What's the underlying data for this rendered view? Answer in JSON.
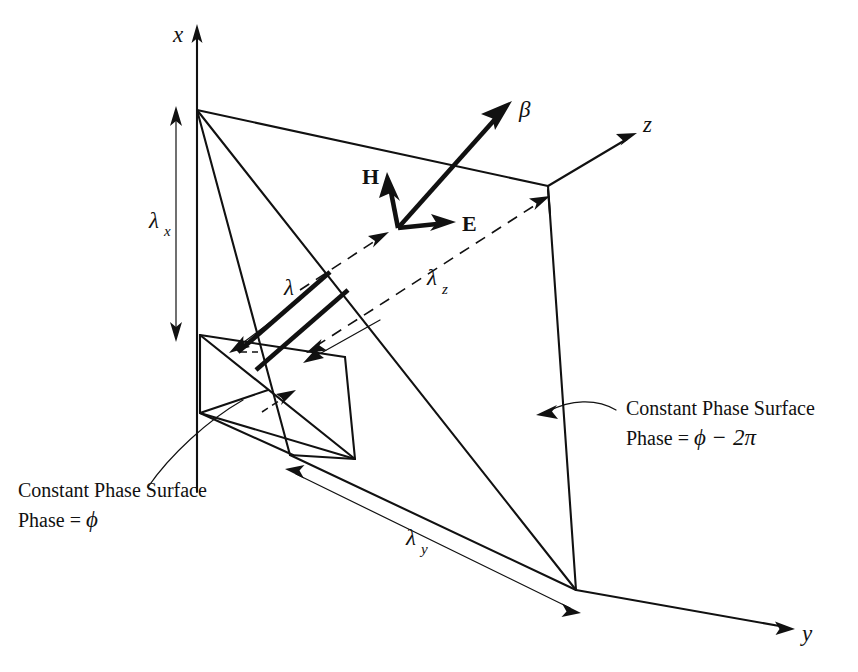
{
  "figure": {
    "background_color": "#ffffff",
    "ink_color": "#111111",
    "width": 858,
    "height": 672
  },
  "axes": [
    {
      "name": "x-axis",
      "label": "x",
      "direction": "up",
      "label_x": 173,
      "label_y": 42
    },
    {
      "name": "y-axis",
      "label": "y",
      "direction": "down-right",
      "label_x": 802,
      "label_y": 641
    },
    {
      "name": "z-axis",
      "label": "z",
      "direction": "up-right",
      "label_x": 643,
      "label_y": 132
    }
  ],
  "vectors": [
    {
      "name": "beta-vector",
      "label": "β",
      "label_x": 519,
      "label_y": 117,
      "style": "greek"
    },
    {
      "name": "h-vector",
      "label": "H",
      "label_x": 362,
      "label_y": 184,
      "style": "bold"
    },
    {
      "name": "e-vector",
      "label": "E",
      "label_x": 462,
      "label_y": 231,
      "style": "bold"
    }
  ],
  "dimensions": [
    {
      "name": "lambda-x",
      "base": "λ",
      "subscript": "x",
      "label_x": 156,
      "label_y": 228,
      "description": "wavelength along x between the two constant phase planes"
    },
    {
      "name": "lambda-y",
      "base": "λ",
      "subscript": "y",
      "label_x": 413,
      "label_y": 545,
      "description": "wavelength along y between the two constant phase planes"
    },
    {
      "name": "lambda-z",
      "base": "λ",
      "subscript": "z",
      "label_x": 434,
      "label_y": 285,
      "description": "wavelength along z between the two constant phase planes"
    },
    {
      "name": "lambda",
      "base": "λ",
      "subscript": "",
      "label_x": 288,
      "label_y": 295,
      "description": "perpendicular distance between the two constant phase planes"
    }
  ],
  "annotations": [
    {
      "name": "near-plane-annotation",
      "line1": "Constant Phase Surface",
      "line2_prefix": "Phase = ",
      "line2_value": "ϕ",
      "line1_x": 18,
      "line1_y": 497,
      "line2_x": 18,
      "line2_y": 527
    },
    {
      "name": "far-plane-annotation",
      "line1": "Constant Phase Surface",
      "line2_prefix": "Phase = ",
      "line2_value": "ϕ − 2π",
      "line1_x": 626,
      "line1_y": 415,
      "line2_x": 626,
      "line2_y": 445
    }
  ]
}
